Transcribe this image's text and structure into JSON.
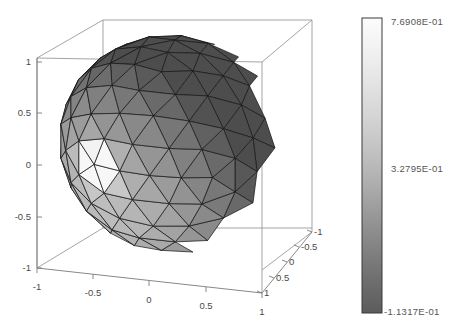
{
  "figure": {
    "type": "3d-surface-plot",
    "background_color": "#ffffff",
    "title": ""
  },
  "chart_data": {
    "type": "heatmap",
    "render": "3d-triangulated-sphere-surface",
    "title": "",
    "xlabel": "",
    "ylabel": "",
    "zlabel": "",
    "grid": false,
    "legend_position": "right",
    "axes": {
      "x": {
        "name": "x-axis-bottom",
        "ticks": [
          "-1",
          "-0.5",
          "0",
          "0.5",
          "1"
        ],
        "values": [
          -1,
          -0.5,
          0,
          0.5,
          1
        ],
        "range": [
          -1,
          1
        ]
      },
      "y": {
        "name": "y-axis-depth-right",
        "ticks": [
          "-1",
          "-0.5",
          "0",
          "0.5",
          "1"
        ],
        "values": [
          -1,
          -0.5,
          0,
          0.5,
          1
        ],
        "range": [
          -1,
          1
        ]
      },
      "z": {
        "name": "z-axis-vertical-left",
        "ticks": [
          "1",
          "0.5",
          "0",
          "-0.5",
          "-1"
        ],
        "values": [
          1,
          0.5,
          0,
          -0.5,
          -1
        ],
        "range": [
          -1,
          1
        ]
      }
    },
    "surface": {
      "shape": "unit-sphere",
      "mesh": "triangular",
      "radius": 1,
      "shading": "flat-gray-with-specular-highlight",
      "edge_color": "#1a1a1a",
      "face_color_min": "#5e5e5e",
      "face_color_max": "#f2f2f2"
    },
    "colorbar": {
      "orientation": "vertical",
      "labels": [
        "7.6908E-01",
        "3.2795E-01",
        "-1.1317E-01"
      ],
      "values": [
        0.76908,
        0.32795,
        -0.11317
      ],
      "vmin": -0.11317,
      "vmax": 0.76908,
      "color_top": "#f8f8f8",
      "color_bottom": "#5a5a5a"
    }
  },
  "plot": {
    "x_ticks": [
      "-1",
      "-0.5",
      "0",
      "0.5",
      "1"
    ],
    "y_ticks": [
      "-1",
      "-0.5",
      "0",
      "0.5",
      "1"
    ],
    "z_ticks": [
      "1",
      "0.5",
      "0",
      "-0.5",
      "-1"
    ]
  },
  "colorbar": {
    "top_label": "7.6908E-01",
    "mid_label": "3.2795E-01",
    "bottom_label": "-1.1317E-01"
  }
}
